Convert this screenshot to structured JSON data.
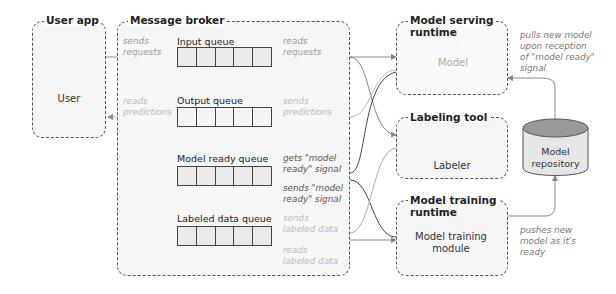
{
  "containers": {
    "user_app": {
      "title": "User app",
      "actor": "User"
    },
    "message_broker": {
      "title": "Message broker"
    },
    "model_serving": {
      "title_line1": "Model serving",
      "title_line2": "runtime",
      "component": "Model"
    },
    "labeling_tool": {
      "title": "Labeling tool",
      "actor": "Labeler"
    },
    "model_training": {
      "title_line1": "Model training",
      "title_line2": "runtime",
      "component_line1": "Model training",
      "component_line2": "module"
    }
  },
  "queues": [
    {
      "label": "Input queue"
    },
    {
      "label": "Output queue"
    },
    {
      "label": "Model ready queue"
    },
    {
      "label": "Labeled data queue"
    }
  ],
  "repository": {
    "line1": "Model",
    "line2": "repository"
  },
  "annotations": {
    "sends_requests": "sends\nrequests",
    "reads_requests": "reads\nrequests",
    "reads_predictions": "reads\npredictions",
    "sends_predictions": "sends\npredictions",
    "gets_model_ready": "gets \"model\nready\" signal",
    "sends_model_ready": "sends \"model\nready\" signal",
    "sends_labeled_data": "sends\nlabeled data",
    "reads_labeled_data": "reads\nlabeled data",
    "pulls_new_model": "pulls new model\nupon reception\nof \"model ready\"\nsignal",
    "pushes_new_model": "pushes new\nmodel as it's\nready"
  }
}
